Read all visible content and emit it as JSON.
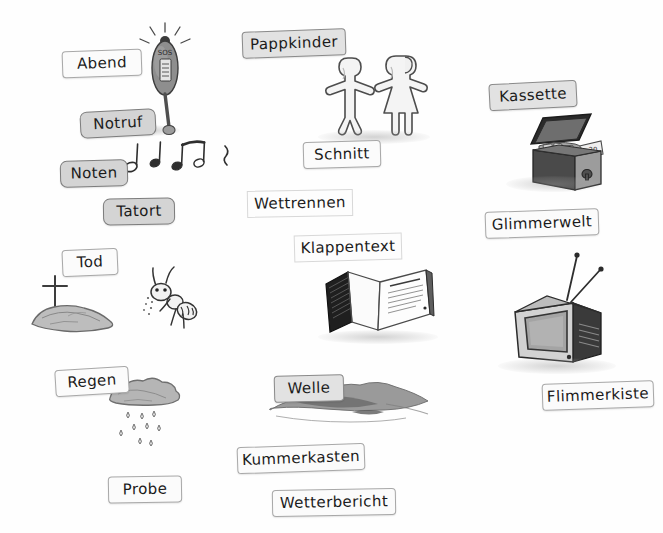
{
  "page": {
    "background_color": "#fefefe",
    "width": 663,
    "height": 533
  },
  "cards": [
    {
      "id": "abend",
      "label": "Abend",
      "x": 62,
      "y": 50,
      "w": 80,
      "rot": -2.0,
      "style": "white round2"
    },
    {
      "id": "notruf",
      "label": "Notruf",
      "x": 80,
      "y": 110,
      "w": 76,
      "rot": -3.0,
      "style": "gray round"
    },
    {
      "id": "noten",
      "label": "Noten",
      "x": 60,
      "y": 160,
      "w": 68,
      "rot": -1.5,
      "style": "gray round"
    },
    {
      "id": "tatort",
      "label": "Tatort",
      "x": 103,
      "y": 198,
      "w": 72,
      "rot": -1.0,
      "style": "gray round"
    },
    {
      "id": "tod",
      "label": "Tod",
      "x": 62,
      "y": 249,
      "w": 56,
      "rot": -2.5,
      "style": "white round2"
    },
    {
      "id": "regen",
      "label": "Regen",
      "x": 55,
      "y": 368,
      "w": 74,
      "rot": -3.5,
      "style": "white round2"
    },
    {
      "id": "probe",
      "label": "Probe",
      "x": 108,
      "y": 476,
      "w": 74,
      "rot": -1.0,
      "style": "white round2"
    },
    {
      "id": "pappkinder",
      "label": "Pappkinder",
      "x": 242,
      "y": 30,
      "w": 104,
      "rot": -2.0,
      "style": "lgray round2"
    },
    {
      "id": "schnitt",
      "label": "Schnitt",
      "x": 303,
      "y": 141,
      "w": 78,
      "rot": -1.5,
      "style": "white round2"
    },
    {
      "id": "wettrennen",
      "label": "Wettrennen",
      "x": 247,
      "y": 190,
      "w": 106,
      "rot": -1.0,
      "style": "faint"
    },
    {
      "id": "klappentext",
      "label": "Klappentext",
      "x": 294,
      "y": 234,
      "w": 108,
      "rot": -1.5,
      "style": "faint"
    },
    {
      "id": "welle",
      "label": "Welle",
      "x": 274,
      "y": 375,
      "w": 70,
      "rot": -1.5,
      "style": "lgray round2"
    },
    {
      "id": "kummerkasten",
      "label": "Kummerkasten",
      "x": 237,
      "y": 445,
      "w": 128,
      "rot": -2.0,
      "style": "white round2"
    },
    {
      "id": "wetterbericht",
      "label": "Wetterbericht",
      "x": 272,
      "y": 489,
      "w": 124,
      "rot": -1.0,
      "style": "white round2"
    },
    {
      "id": "kassette",
      "label": "Kassette",
      "x": 489,
      "y": 82,
      "w": 88,
      "rot": -3.0,
      "style": "lgray round2"
    },
    {
      "id": "glimmerwelt",
      "label": "Glimmerwelt",
      "x": 485,
      "y": 210,
      "w": 114,
      "rot": -2.0,
      "style": "white round2"
    },
    {
      "id": "flimmerkiste",
      "label": "Flimmerkiste",
      "x": 542,
      "y": 382,
      "w": 112,
      "rot": -2.0,
      "style": "white round2"
    }
  ],
  "illustrations": [
    {
      "id": "emergency-beacon",
      "name": "emergency-beacon-illustration",
      "caption": "SOS",
      "x": 135,
      "y": 22,
      "w": 60,
      "h": 115
    },
    {
      "id": "music-notes",
      "name": "music-notes-illustration",
      "caption": "",
      "x": 124,
      "y": 135,
      "w": 110,
      "h": 45
    },
    {
      "id": "paper-children",
      "name": "paper-cutout-children-illustration",
      "caption": "",
      "x": 318,
      "y": 48,
      "w": 110,
      "h": 92
    },
    {
      "id": "grave",
      "name": "grave-with-cross-illustration",
      "caption": "",
      "x": 28,
      "y": 272,
      "w": 100,
      "h": 62
    },
    {
      "id": "ant",
      "name": "ant-illustration",
      "caption": "",
      "x": 140,
      "y": 268,
      "w": 56,
      "h": 66
    },
    {
      "id": "rain-cloud",
      "name": "rain-cloud-illustration",
      "caption": "",
      "x": 108,
      "y": 372,
      "w": 80,
      "h": 80
    },
    {
      "id": "money-box",
      "name": "open-money-box-illustration",
      "caption": "20",
      "x": 517,
      "y": 112,
      "w": 92,
      "h": 85
    },
    {
      "id": "open-book",
      "name": "open-book-illustration",
      "caption": "",
      "x": 322,
      "y": 262,
      "w": 114,
      "h": 80
    },
    {
      "id": "television",
      "name": "vintage-television-illustration",
      "caption": "",
      "x": 505,
      "y": 252,
      "w": 110,
      "h": 115
    },
    {
      "id": "wave",
      "name": "ink-wave-illustration",
      "caption": "",
      "x": 268,
      "y": 378,
      "w": 160,
      "h": 55
    }
  ]
}
